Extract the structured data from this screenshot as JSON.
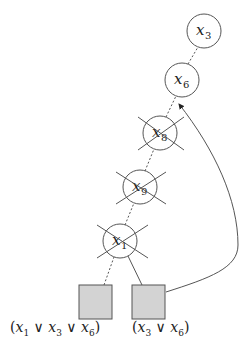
{
  "diagram": {
    "type": "implication-graph",
    "colors": {
      "stroke": "#555555",
      "clause_fill": "#d3d3d3",
      "background": "#ffffff"
    },
    "nodes": [
      {
        "id": "x3",
        "var": "x",
        "sub": "3",
        "crossed": false
      },
      {
        "id": "x6",
        "var": "x",
        "sub": "6",
        "crossed": false
      },
      {
        "id": "x8",
        "var": "x",
        "sub": "8",
        "crossed": true
      },
      {
        "id": "x9",
        "var": "x",
        "sub": "9",
        "crossed": true
      },
      {
        "id": "x1",
        "var": "x",
        "sub": "1",
        "crossed": true
      }
    ],
    "clauses": [
      {
        "id": "c1",
        "label_parts": [
          "(",
          "x",
          "1",
          " ∨ ",
          "x",
          "3",
          " ∨ ",
          "x",
          "6",
          ")"
        ],
        "label": "(x1 ∨ x3 ∨ x6)"
      },
      {
        "id": "c2",
        "label_parts": [
          "(",
          "x",
          "3",
          " ∨ ",
          "x",
          "6",
          ")"
        ],
        "label": "(x3 ∨ x6)"
      }
    ],
    "edges": [
      {
        "from": "x6",
        "to": "x3",
        "style": "dotted"
      },
      {
        "from": "x8",
        "to": "x6",
        "style": "dotted"
      },
      {
        "from": "x9",
        "to": "x8",
        "style": "dotted"
      },
      {
        "from": "x1",
        "to": "x9",
        "style": "dotted"
      },
      {
        "from": "c1",
        "to": "x1",
        "style": "dotted"
      },
      {
        "from": "c2",
        "to": "x1",
        "style": "solid"
      },
      {
        "from": "c2",
        "to": "x6",
        "style": "solid-curved-arrow"
      }
    ]
  }
}
